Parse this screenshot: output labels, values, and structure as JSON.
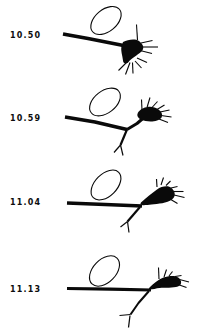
{
  "figure": {
    "background": "#ffffff",
    "ink": "#0a0a0a",
    "description_labels": [
      "10.50",
      "10.59",
      "11.04",
      "11.13"
    ],
    "panels": [
      {
        "time": "10.50",
        "ellipse": {
          "cx": 106,
          "cy": 20.5,
          "rx": 17.5,
          "ry": 11,
          "rot": -40,
          "w": 1.1
        },
        "trunk": {
          "d": "M63,34 L88,38.5 L126,46",
          "w": 3.8
        },
        "branches": [],
        "cone": "M123,42 C128,39.5 135,38.5 139,41 C143,44 145,48 141.5,51.5 C137,55.5 131,58.5 128.5,62 C126.5,64.5 123,63.5 123,60.5 C122.5,55.5 120.5,50.5 121.5,46.5 Z",
        "spikes": [
          [
            137.5,
            40,
            136.5,
            24.5
          ],
          [
            141,
            43,
            152.5,
            40.5
          ],
          [
            142,
            47,
            158,
            47
          ],
          [
            140,
            50.5,
            152,
            53.5
          ],
          [
            128,
            61,
            118.5,
            70.5
          ],
          [
            130,
            62.5,
            125.5,
            74.5
          ],
          [
            132.5,
            62.5,
            133,
            73.5
          ],
          [
            135,
            61,
            141.5,
            68
          ],
          [
            137,
            58,
            147,
            62.5
          ]
        ]
      },
      {
        "time": "10.59",
        "ellipse": {
          "cx": 105,
          "cy": 102,
          "rx": 17.5,
          "ry": 11,
          "rot": -38,
          "w": 1.1
        },
        "trunk": {
          "d": "M65,117 L95,122 L127,129.5",
          "w": 3.6
        },
        "branches": [
          {
            "d": "M127,129.5 L137,123.5 L144,117.5",
            "w": 3
          },
          {
            "d": "M127,129.5 L120.5,145",
            "w": 2.2
          },
          {
            "d": "M120.5,145 L114,152.5",
            "w": 1.2
          },
          {
            "d": "M120.5,145 L123,155.5",
            "w": 1.2
          }
        ],
        "cone": "M138,112.5 C141.5,107.5 149,105.5 154.5,107.5 C160,109.5 163.5,113.5 161.5,117.5 C159,121.5 151,122 145.5,121 C140.5,120 135.5,117.5 138,112.5 Z",
        "spikes": [
          [
            142,
            110,
            141.5,
            99.5
          ],
          [
            147,
            107.5,
            150,
            97.5
          ],
          [
            152,
            107.5,
            157.5,
            101.5
          ],
          [
            157,
            109.5,
            164.5,
            105
          ],
          [
            160,
            112,
            169.5,
            110
          ],
          [
            161,
            115.5,
            171.5,
            117
          ],
          [
            159,
            119,
            168,
            122.5
          ]
        ]
      },
      {
        "time": "11.04",
        "ellipse": {
          "cx": 106,
          "cy": 185,
          "rx": 18,
          "ry": 11,
          "rot": -45,
          "w": 1.1
        },
        "trunk": {
          "d": "M67,203 L105,204.5 L142,206",
          "w": 3.6
        },
        "branches": [
          {
            "d": "M140,207 L127.5,221.5",
            "w": 2.2
          },
          {
            "d": "M127.5,221.5 L120.5,227",
            "w": 1.2
          },
          {
            "d": "M127.5,221.5 L129,232.5",
            "w": 1.2
          }
        ],
        "cone": "M141,202.5 C145.5,198.5 152,193 157,189.5 C161.5,186.5 168,185 171.5,188 C175.5,191.5 176,196.5 172,199.5 C167,203 158,204 151.5,204.5 C146,205 138.5,206.5 141,202.5 Z",
        "spikes": [
          [
            157,
            187,
            156.5,
            179
          ],
          [
            161,
            185,
            163.5,
            177.5
          ],
          [
            166,
            185.5,
            170.5,
            181
          ],
          [
            171,
            188,
            177.5,
            186.5
          ],
          [
            174,
            191.5,
            183.5,
            191.5
          ],
          [
            174,
            195,
            184.5,
            197.5
          ],
          [
            170,
            199,
            177.5,
            203.5
          ]
        ]
      },
      {
        "time": "11.13",
        "ellipse": {
          "cx": 104.5,
          "cy": 271,
          "rx": 18,
          "ry": 11.5,
          "rot": -46,
          "w": 1.1
        },
        "trunk": {
          "d": "M67,288.5 L110,289.2 L151,290",
          "w": 3.2
        },
        "branches": [
          {
            "d": "M149,291 L138.5,303 L130.5,314.5",
            "w": 2
          },
          {
            "d": "M130.5,314.5 L119.5,315.5",
            "w": 1.2
          },
          {
            "d": "M130,315.5 L128.5,327.5",
            "w": 1.2
          }
        ],
        "cone": "M149.5,287.5 C153.5,283.5 158.5,279.5 163.5,277.5 C168.5,275.5 176,275 179,278 C182,281 182,285 178,286.5 C173,288 165,287.5 159.5,288 C154.5,288.5 146.5,291.5 149.5,287.5 Z",
        "spikes": [
          [
            159,
            279,
            158.5,
            267.5
          ],
          [
            164,
            277,
            166.5,
            269.5
          ],
          [
            169,
            276,
            172.5,
            271.5
          ],
          [
            175,
            276.5,
            181.5,
            275.5
          ],
          [
            179.5,
            279.5,
            189,
            282
          ],
          [
            178,
            284.5,
            186.5,
            287.5
          ]
        ]
      }
    ]
  }
}
